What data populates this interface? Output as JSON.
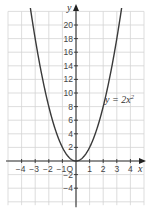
{
  "chart_data": {
    "type": "line",
    "title": "",
    "xlabel": "x",
    "ylabel": "y",
    "xlim": [
      -5,
      5
    ],
    "ylim": [
      -7,
      22
    ],
    "grid": true,
    "x_ticks": [
      -4,
      -3,
      -2,
      -1,
      1,
      2,
      3,
      4
    ],
    "y_ticks": [
      -4,
      -2,
      2,
      4,
      6,
      8,
      10,
      12,
      14,
      16,
      18,
      20
    ],
    "origin_label": "O",
    "series": [
      {
        "name": "y = 2x²",
        "equation": "y = 2x^2",
        "x": [
          -3.3,
          -3,
          -2.5,
          -2,
          -1.5,
          -1,
          -0.5,
          0,
          0.5,
          1,
          1.5,
          2,
          2.5,
          3,
          3.3
        ],
        "y": [
          21.78,
          18,
          12.5,
          8,
          4.5,
          2,
          0.5,
          0,
          0.5,
          2,
          4.5,
          8,
          12.5,
          18,
          21.78
        ]
      }
    ],
    "annotations": [
      {
        "text": "y = 2x²",
        "x": 3.2,
        "y": 9.5
      }
    ]
  },
  "labels": {
    "x_axis": "x",
    "y_axis": "y",
    "origin": "O",
    "equation_main": "y = 2x",
    "equation_exp": "2"
  }
}
